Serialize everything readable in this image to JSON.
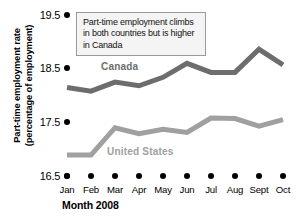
{
  "chart_data": {
    "type": "line",
    "title": "",
    "xlabel": "Month 2008",
    "ylabel": "Part-time employment rate\n(percentage of employment)",
    "categories": [
      "Jan",
      "Feb",
      "Mar",
      "Apr",
      "May",
      "Jun",
      "Jul",
      "Aug",
      "Sept",
      "Oct"
    ],
    "yticks": [
      16.5,
      17.5,
      18.5,
      19.5
    ],
    "ylim": [
      16.5,
      19.5
    ],
    "grid": false,
    "legend_position": "inline-series-labels",
    "annotations": [
      "Part-time employment climbs in both countries but is higher in Canada"
    ],
    "series": [
      {
        "name": "Canada",
        "color": "#6d6d6d",
        "values": [
          18.15,
          18.08,
          18.25,
          18.18,
          18.34,
          18.6,
          18.43,
          18.43,
          18.86,
          18.57
        ]
      },
      {
        "name": "United States",
        "color": "#a0a0a0",
        "values": [
          16.89,
          16.89,
          17.4,
          17.29,
          17.37,
          17.31,
          17.58,
          17.57,
          17.43,
          17.55
        ]
      }
    ]
  },
  "axes": {
    "y_title_line1": "Part-time employment rate",
    "y_title_line2": "(percentage of employment)",
    "y_ticks": [
      "19.5",
      "18.5",
      "17.5",
      "16.5"
    ],
    "x_title": "Month 2008",
    "x_labels": [
      "Jan",
      "Feb",
      "Mar",
      "Apr",
      "May",
      "Jun",
      "Jul",
      "Aug",
      "Sept",
      "Oct"
    ]
  },
  "callout": {
    "line1": "Part-time employment climbs",
    "line2": "in both countries but is higher",
    "line3": "in Canada"
  },
  "series_labels": {
    "canada": "Canada",
    "united_states": "United States"
  },
  "colors": {
    "canada": "#6d6d6d",
    "united_states": "#a0a0a0",
    "axis": "#000000",
    "callout_border": "#9a9a9a",
    "callout_fill": "#f4f4f4"
  }
}
